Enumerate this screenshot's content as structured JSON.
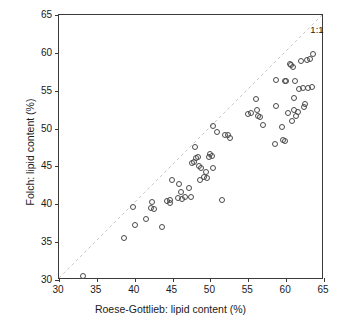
{
  "chart_data": {
    "type": "scatter",
    "title": "",
    "xlabel": "Roese-Gottlieb: lipid content (%)",
    "ylabel": "Folch: lipid content (%)",
    "xlim": [
      30,
      65
    ],
    "ylim": [
      30,
      65
    ],
    "xticks": [
      30,
      35,
      40,
      45,
      50,
      55,
      60,
      65
    ],
    "yticks": [
      30,
      35,
      40,
      45,
      50,
      55,
      60,
      65
    ],
    "xticklabels": [
      "30",
      "35",
      "40",
      "45",
      "50",
      "55",
      "60",
      "65"
    ],
    "yticklabels": [
      "30",
      "35",
      "40",
      "45",
      "50",
      "55",
      "60",
      "65"
    ],
    "grid": false,
    "legend": null,
    "marker": "open-circle",
    "marker_color": "#4a4a4a",
    "reference_line": {
      "label": "1:1",
      "style": "dashed",
      "color": "#c8c8c8",
      "from": [
        30,
        30
      ],
      "to": [
        65,
        65
      ],
      "label_x": 63.2,
      "label_y": 63.0
    },
    "annotations": [
      {
        "text": "1:1",
        "x": 63.2,
        "y": 63.0
      }
    ],
    "points": [
      [
        33.2,
        30.5
      ],
      [
        38.6,
        35.5
      ],
      [
        39.8,
        39.6
      ],
      [
        40.1,
        37.3
      ],
      [
        41.5,
        38.0
      ],
      [
        42.1,
        39.5
      ],
      [
        42.3,
        40.3
      ],
      [
        42.6,
        39.4
      ],
      [
        43.6,
        37.0
      ],
      [
        44.2,
        40.4
      ],
      [
        44.6,
        40.2
      ],
      [
        44.7,
        40.6
      ],
      [
        44.9,
        43.2
      ],
      [
        45.7,
        40.8
      ],
      [
        45.9,
        42.7
      ],
      [
        46.1,
        41.6
      ],
      [
        46.3,
        40.7
      ],
      [
        46.6,
        40.9
      ],
      [
        47.2,
        42.2
      ],
      [
        47.4,
        40.9
      ],
      [
        47.6,
        45.4
      ],
      [
        47.8,
        45.6
      ],
      [
        48.0,
        47.6
      ],
      [
        48.1,
        46.1
      ],
      [
        48.3,
        46.3
      ],
      [
        48.5,
        45.0
      ],
      [
        48.6,
        43.2
      ],
      [
        48.8,
        44.8
      ],
      [
        49.2,
        43.6
      ],
      [
        49.4,
        44.3
      ],
      [
        49.6,
        43.5
      ],
      [
        49.8,
        46.3
      ],
      [
        50.0,
        46.6
      ],
      [
        50.2,
        46.4
      ],
      [
        50.3,
        50.3
      ],
      [
        50.4,
        44.8
      ],
      [
        50.9,
        49.6
      ],
      [
        51.5,
        40.6
      ],
      [
        51.9,
        49.2
      ],
      [
        52.3,
        49.2
      ],
      [
        52.6,
        48.8
      ],
      [
        55.0,
        51.9
      ],
      [
        55.4,
        52.0
      ],
      [
        56.0,
        53.9
      ],
      [
        56.2,
        52.4
      ],
      [
        56.3,
        51.6
      ],
      [
        56.5,
        51.5
      ],
      [
        56.9,
        50.5
      ],
      [
        58.5,
        48.0
      ],
      [
        58.6,
        53.0
      ],
      [
        58.7,
        56.4
      ],
      [
        59.4,
        50.2
      ],
      [
        59.6,
        48.5
      ],
      [
        59.8,
        56.3
      ],
      [
        59.9,
        48.4
      ],
      [
        60.0,
        56.3
      ],
      [
        60.3,
        52.0
      ],
      [
        60.5,
        58.5
      ],
      [
        60.7,
        58.4
      ],
      [
        60.8,
        51.0
      ],
      [
        60.9,
        58.1
      ],
      [
        61.0,
        54.0
      ],
      [
        61.1,
        52.4
      ],
      [
        61.2,
        56.3
      ],
      [
        61.3,
        51.7
      ],
      [
        61.5,
        52.2
      ],
      [
        61.7,
        55.2
      ],
      [
        61.9,
        58.9
      ],
      [
        62.2,
        55.3
      ],
      [
        62.4,
        52.9
      ],
      [
        62.5,
        53.2
      ],
      [
        62.7,
        59.1
      ],
      [
        62.9,
        55.4
      ],
      [
        63.1,
        59.2
      ],
      [
        63.4,
        55.5
      ],
      [
        63.6,
        59.9
      ]
    ]
  }
}
